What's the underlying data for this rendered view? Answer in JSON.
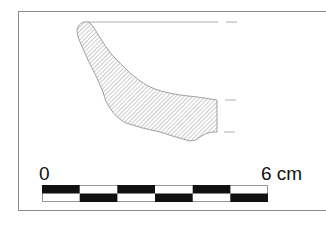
{
  "figure": {
    "type": "archaeological pottery profile drawing",
    "hatching": "diagonal",
    "colors": {
      "outline": "#8a8a8a",
      "hatch": "#9a9a9a",
      "scale_dark": "#111111",
      "scale_light": "#ffffff"
    }
  },
  "scale": {
    "start_label": "0",
    "end_label": "6 cm",
    "segments": 6
  }
}
